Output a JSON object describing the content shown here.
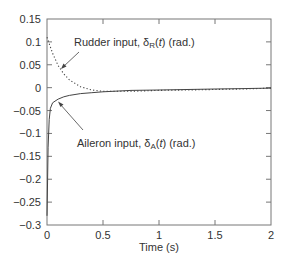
{
  "chart_data": {
    "type": "line",
    "title": "",
    "xlabel": "Time (s)",
    "ylabel": "",
    "xlim": [
      0,
      2
    ],
    "ylim": [
      -0.3,
      0.15
    ],
    "grid": false,
    "legend": "none (inline annotations with arrows)",
    "xticks": [
      0,
      0.5,
      1,
      1.5,
      2
    ],
    "xtick_labels": [
      "0",
      "0.5",
      "1",
      "1.5",
      "2"
    ],
    "yticks": [
      0.15,
      0.1,
      0.05,
      0,
      -0.05,
      -0.1,
      -0.15,
      -0.2,
      -0.25,
      -0.3
    ],
    "ytick_labels": [
      "0.15",
      "0.1",
      "0.05",
      "0",
      "−0.05",
      "−0.1",
      "−0.15",
      "−0.2",
      "−0.25",
      "−0.3"
    ],
    "series": [
      {
        "name": "Rudder input, δR(t) (rad.)",
        "style": "dotted",
        "x": [
          0,
          0.05,
          0.1,
          0.15,
          0.2,
          0.3,
          0.4,
          0.5,
          0.75,
          1.0,
          1.25,
          1.5,
          1.75,
          2.0
        ],
        "values": [
          0.11,
          0.075,
          0.048,
          0.03,
          0.017,
          0.002,
          -0.005,
          -0.008,
          -0.008,
          -0.006,
          -0.005,
          -0.004,
          -0.003,
          -0.001
        ]
      },
      {
        "name": "Aileron input, δA(t) (rad.)",
        "style": "solid",
        "x": [
          0,
          0.005,
          0.01,
          0.02,
          0.03,
          0.05,
          0.08,
          0.1,
          0.15,
          0.2,
          0.3,
          0.4,
          0.5,
          0.75,
          1.0,
          1.25,
          1.5,
          1.75,
          2.0
        ],
        "values": [
          -0.28,
          -0.2,
          -0.13,
          -0.07,
          -0.045,
          -0.033,
          -0.028,
          -0.025,
          -0.02,
          -0.017,
          -0.013,
          -0.011,
          -0.009,
          -0.006,
          -0.005,
          -0.004,
          -0.003,
          -0.002,
          -0.001
        ]
      }
    ],
    "annotations": [
      {
        "text_prefix": "Rudder input, ",
        "symbol": "δ",
        "subscript": "R",
        "suffix": "(t) (rad.)",
        "points_to": [
          0.04,
          0.05
        ]
      },
      {
        "text_prefix": "Aileron input, ",
        "symbol": "δ",
        "subscript": "A",
        "suffix": "(t) (rad.)",
        "points_to": [
          0.09,
          -0.028
        ]
      }
    ]
  },
  "labels": {
    "rudder_prefix": "Rudder input, ",
    "rudder_symbol": "δ",
    "rudder_sub": "R",
    "rudder_t": "t",
    "rudder_suffix": " (rad.)",
    "aileron_prefix": "Aileron input, ",
    "aileron_symbol": "δ",
    "aileron_sub": "A",
    "aileron_t": "t",
    "aileron_suffix": " (rad.)",
    "xlabel": "Time (s)"
  },
  "colors": {
    "line": "#444444",
    "axis": "#666666",
    "text": "#333333"
  }
}
